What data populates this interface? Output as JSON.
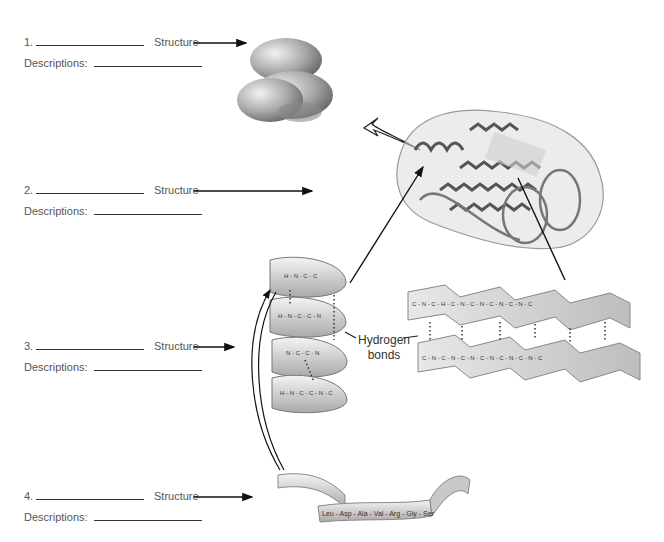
{
  "worksheet": {
    "rows": [
      {
        "number": "1.",
        "structure_label": "Structure",
        "descriptions_label": "Descriptions:"
      },
      {
        "number": "2.",
        "structure_label": "Structure",
        "descriptions_label": "Descriptions:"
      },
      {
        "number": "3.",
        "structure_label": "Structure",
        "descriptions_label": "Descriptions:"
      },
      {
        "number": "4.",
        "structure_label": "Structure",
        "descriptions_label": "Descriptions:"
      }
    ]
  },
  "illustrations": {
    "quaternary": {
      "icon": "protein-subunits-blob"
    },
    "tertiary": {
      "icon": "folded-protein-ribbon"
    },
    "alpha_helix": {
      "icon": "alpha-helix-ribbon",
      "atoms": [
        "C",
        "N",
        "H",
        "O"
      ]
    },
    "beta_sheet": {
      "icon": "pleated-sheet",
      "atoms": [
        "C",
        "N",
        "H",
        "O"
      ]
    },
    "primary": {
      "icon": "amino-acid-ribbon",
      "sequence": "Leu - Asp - Ala - Val - Arg - Gly - Ser"
    }
  },
  "labels": {
    "hydrogen_bonds_line1": "Hydrogen",
    "hydrogen_bonds_line2": "bonds"
  },
  "colors": {
    "ink": "#333333",
    "shape_gray": "#9a9a9a"
  }
}
